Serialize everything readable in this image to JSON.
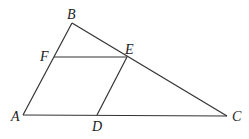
{
  "figure": {
    "type": "geometry-diagram",
    "points": {
      "A": {
        "label": "A",
        "x": 23,
        "y": 115
      },
      "B": {
        "label": "B",
        "x": 72,
        "y": 23
      },
      "C": {
        "label": "C",
        "x": 227,
        "y": 116
      },
      "D": {
        "label": "D",
        "x": 97,
        "y": 115
      },
      "E": {
        "label": "E",
        "x": 127,
        "y": 57
      },
      "F": {
        "label": "F",
        "x": 54,
        "y": 57
      }
    },
    "segments": [
      [
        "A",
        "B"
      ],
      [
        "B",
        "C"
      ],
      [
        "A",
        "C"
      ],
      [
        "F",
        "E"
      ],
      [
        "E",
        "D"
      ]
    ],
    "labels": {
      "A": "A",
      "B": "B",
      "C": "C",
      "D": "D",
      "E": "E",
      "F": "F"
    }
  }
}
